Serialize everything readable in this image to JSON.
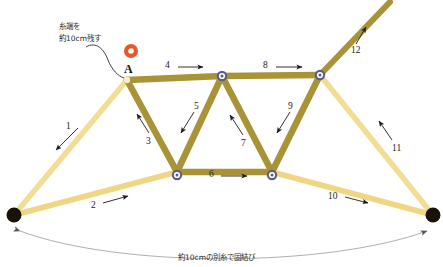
{
  "diagram": {
    "colors": {
      "strand_dark": "#a89337",
      "strand_light": "#f2d98b",
      "node_ring": "#5a5f86",
      "node_fill": "#ffffff",
      "start_marker": "#e8562a",
      "anchor_dot": "#1a1208",
      "arrow": "#1b1b1b",
      "text": "#1b1b1b"
    },
    "annotations": {
      "start_note_line1": "糸端を",
      "start_note_line2": "約10cm残す",
      "bottom_note": "約10cmの別糸で固結び",
      "start_point_label": "A"
    },
    "step_labels": [
      {
        "id": "1",
        "text": "1",
        "x": 66,
        "y": 122
      },
      {
        "id": "2",
        "text": "2",
        "x": 91,
        "y": 201
      },
      {
        "id": "3",
        "text": "3",
        "x": 146,
        "y": 137
      },
      {
        "id": "4",
        "text": "4",
        "x": 165,
        "y": 63
      },
      {
        "id": "5",
        "text": "5",
        "x": 194,
        "y": 105
      },
      {
        "id": "6",
        "text": "6",
        "x": 209,
        "y": 172
      },
      {
        "id": "7",
        "text": "7",
        "x": 241,
        "y": 139
      },
      {
        "id": "8",
        "text": "8",
        "x": 263,
        "y": 63
      },
      {
        "id": "9",
        "text": "9",
        "x": 288,
        "y": 105
      },
      {
        "id": "10",
        "text": "10",
        "x": 330,
        "y": 193
      },
      {
        "id": "11",
        "text": "11",
        "x": 393,
        "y": 144
      },
      {
        "id": "12",
        "text": "12",
        "x": 353,
        "y": 50
      }
    ],
    "nodes": [
      {
        "name": "node-a",
        "x": 127,
        "y": 80,
        "type": "start"
      },
      {
        "name": "node-top-middle",
        "x": 222,
        "y": 76,
        "type": "ring"
      },
      {
        "name": "node-top-right",
        "x": 320,
        "y": 75,
        "type": "ring"
      },
      {
        "name": "node-bottom-left",
        "x": 177,
        "y": 172,
        "type": "ring"
      },
      {
        "name": "node-bottom-right",
        "x": 272,
        "y": 172,
        "type": "ring"
      },
      {
        "name": "anchor-left",
        "x": 14,
        "y": 215,
        "type": "anchor"
      },
      {
        "name": "anchor-right",
        "x": 433,
        "y": 215,
        "type": "anchor"
      }
    ],
    "segments": [
      {
        "name": "segment-1",
        "from": "anchor-left",
        "to": "node-a",
        "tone": "light"
      },
      {
        "name": "segment-2",
        "from": "anchor-left",
        "to": "node-bottom-left",
        "tone": "light"
      },
      {
        "name": "segment-3",
        "from": "node-a",
        "to": "node-bottom-left",
        "tone": "dark"
      },
      {
        "name": "segment-4",
        "from": "node-a",
        "to": "node-top-middle",
        "tone": "dark"
      },
      {
        "name": "segment-5",
        "from": "node-top-middle",
        "to": "node-bottom-left",
        "tone": "dark"
      },
      {
        "name": "segment-6",
        "from": "node-bottom-left",
        "to": "node-bottom-right",
        "tone": "dark"
      },
      {
        "name": "segment-7",
        "from": "node-top-middle",
        "to": "node-bottom-right",
        "tone": "dark"
      },
      {
        "name": "segment-8",
        "from": "node-top-middle",
        "to": "node-top-right",
        "tone": "dark"
      },
      {
        "name": "segment-9",
        "from": "node-top-right",
        "to": "node-bottom-right",
        "tone": "dark"
      },
      {
        "name": "segment-10",
        "from": "node-bottom-right",
        "to": "anchor-right",
        "tone": "light"
      },
      {
        "name": "segment-11",
        "from": "node-top-right",
        "to": "anchor-right",
        "tone": "light"
      },
      {
        "name": "segment-12",
        "from": "node-top-right",
        "to": "tail-top",
        "tone": "dark"
      }
    ]
  }
}
